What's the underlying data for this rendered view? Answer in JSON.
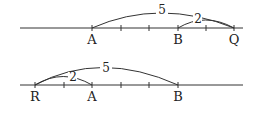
{
  "diagrams": [
    {
      "name": "number-line-1",
      "points": [
        {
          "label": "A",
          "x": 92
        },
        {
          "label": "B",
          "x": 178
        },
        {
          "label": "Q",
          "x": 234
        }
      ],
      "ticks": [
        92,
        121,
        149,
        178,
        206,
        234
      ],
      "arcs": [
        {
          "from": "A",
          "to": "Q",
          "label": "5"
        },
        {
          "from": "B",
          "to": "Q",
          "label": "2"
        }
      ]
    },
    {
      "name": "number-line-2",
      "points": [
        {
          "label": "R",
          "x": 35
        },
        {
          "label": "A",
          "x": 92
        },
        {
          "label": "B",
          "x": 178
        }
      ],
      "ticks": [
        35,
        64,
        92,
        121,
        149,
        178
      ],
      "arcs": [
        {
          "from": "R",
          "to": "B",
          "label": "5"
        },
        {
          "from": "R",
          "to": "A",
          "label": "2"
        }
      ]
    }
  ]
}
